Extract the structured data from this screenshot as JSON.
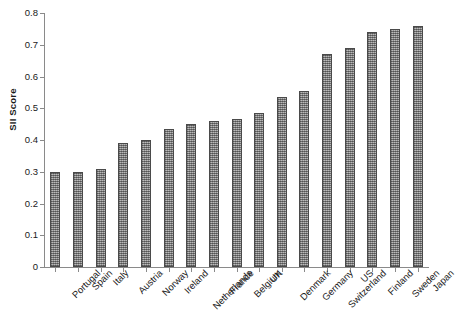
{
  "chart_data": {
    "type": "bar",
    "title": "",
    "xlabel": "",
    "ylabel": "SII Score",
    "ylim": [
      0,
      0.8
    ],
    "grid": false,
    "legend": false,
    "y_ticks": [
      "0",
      "0.1",
      "0.2",
      "0.3",
      "0.4",
      "0.5",
      "0.6",
      "0.7",
      "0.8"
    ],
    "y_tick_values": [
      0,
      0.1,
      0.2,
      0.3,
      0.4,
      0.5,
      0.6,
      0.7,
      0.8
    ],
    "categories": [
      "Portugal",
      "Spain",
      "Italy",
      "Austria",
      "Norway",
      "Ireland",
      "Netherlands",
      "France",
      "Belgium",
      "UK",
      "Denmark",
      "Germany",
      "Switzerland",
      "US",
      "Finland",
      "Sweden",
      "Japan"
    ],
    "values": [
      0.3,
      0.3,
      0.31,
      0.39,
      0.4,
      0.435,
      0.45,
      0.46,
      0.465,
      0.485,
      0.535,
      0.555,
      0.67,
      0.69,
      0.74,
      0.75,
      0.76
    ],
    "series": [
      {
        "name": "SII Score",
        "values": [
          0.3,
          0.3,
          0.31,
          0.39,
          0.4,
          0.435,
          0.45,
          0.46,
          0.465,
          0.485,
          0.535,
          0.555,
          0.67,
          0.69,
          0.74,
          0.75,
          0.76
        ]
      }
    ],
    "bar_fill_color": "#9a9a9a",
    "bar_edge_color": "#4a4a4a",
    "axis_color": "#8a8a8a",
    "background_color": "#ffffff"
  }
}
